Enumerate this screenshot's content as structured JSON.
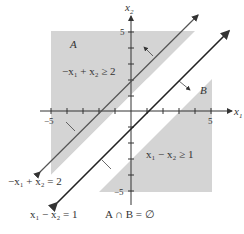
{
  "diagram": {
    "axes": {
      "x_label": "x",
      "x_sub": "1",
      "y_label": "x",
      "y_sub": "2",
      "tick_pos": "5",
      "tick_neg": "−5"
    },
    "regions": {
      "A": {
        "name": "A",
        "inequality": "−x₁ + x₂ ≥ 2"
      },
      "B": {
        "name": "B",
        "inequality": "x₁ − x₂ ≥ 1"
      }
    },
    "lines": {
      "line1": "−x₁ + x₂ = 2",
      "line2": "x₁ − x₂ = 1"
    },
    "caption": "A ∩ B = ∅",
    "colors": {
      "region_fill": "#d4d4d4",
      "line": "#333333"
    }
  }
}
